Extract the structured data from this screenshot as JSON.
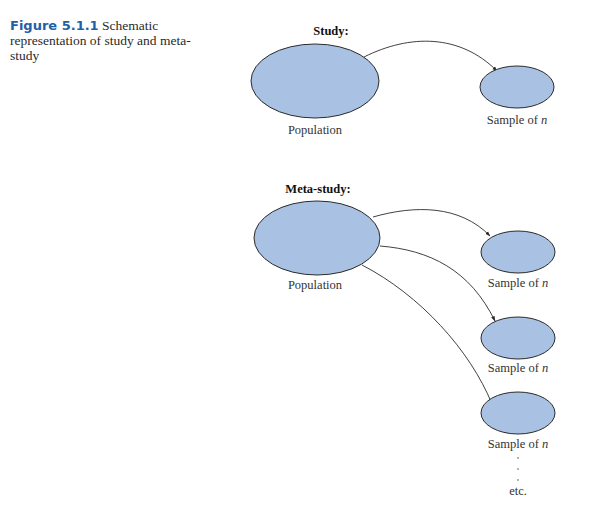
{
  "caption": {
    "figure_number": "Figure 5.1.1",
    "text": "Schematic representation of study and meta-study"
  },
  "colors": {
    "ellipse_fill": "#a9c1e2",
    "ellipse_stroke": "#2b2b2b",
    "figure_label": "#1f5fa8"
  },
  "study": {
    "title": "Study:",
    "population_label": "Population",
    "sample_label": "Sample of ",
    "sample_var": "n"
  },
  "meta_study": {
    "title": "Meta-study:",
    "population_label": "Population",
    "samples": [
      {
        "label": "Sample of ",
        "var": "n"
      },
      {
        "label": "Sample of ",
        "var": "n"
      },
      {
        "label": "Sample of ",
        "var": "n"
      }
    ],
    "continuation": "etc."
  }
}
